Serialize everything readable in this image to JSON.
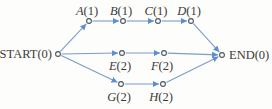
{
  "diagram": {
    "type": "activity-network",
    "background": "#fdfdfc",
    "edge_color": "#7d9cc8",
    "arrow_color": "#5c8fd2",
    "node_fill": "#fdfdfc",
    "node_stroke": "#4c5560",
    "label_color": "#3c3a38",
    "nodes": [
      {
        "id": "start",
        "name": "START",
        "value": "(0)",
        "italic": false,
        "x": 58,
        "y": 54,
        "label_pos": "left"
      },
      {
        "id": "a",
        "name": "A",
        "value": "(1)",
        "italic": true,
        "x": 89,
        "y": 21,
        "label_pos": "above"
      },
      {
        "id": "b",
        "name": "B",
        "value": "(1)",
        "italic": true,
        "x": 123,
        "y": 21,
        "label_pos": "above"
      },
      {
        "id": "c",
        "name": "C",
        "value": "(1)",
        "italic": true,
        "x": 158,
        "y": 21,
        "label_pos": "above"
      },
      {
        "id": "d",
        "name": "D",
        "value": "(1)",
        "italic": true,
        "x": 191,
        "y": 21,
        "label_pos": "above"
      },
      {
        "id": "e",
        "name": "E",
        "value": "(2)",
        "italic": true,
        "x": 122,
        "y": 53,
        "label_pos": "below"
      },
      {
        "id": "f",
        "name": "F",
        "value": "(2)",
        "italic": true,
        "x": 164,
        "y": 53,
        "label_pos": "below"
      },
      {
        "id": "g",
        "name": "G",
        "value": "(2)",
        "italic": true,
        "x": 121,
        "y": 84,
        "label_pos": "below"
      },
      {
        "id": "h",
        "name": "H",
        "value": "(2)",
        "italic": true,
        "x": 163,
        "y": 84,
        "label_pos": "below"
      },
      {
        "id": "end",
        "name": "END",
        "value": "(0)",
        "italic": false,
        "x": 222,
        "y": 55,
        "label_pos": "right"
      }
    ],
    "edges": [
      {
        "from": "start",
        "to": "a"
      },
      {
        "from": "a",
        "to": "b"
      },
      {
        "from": "b",
        "to": "c"
      },
      {
        "from": "c",
        "to": "d"
      },
      {
        "from": "d",
        "to": "end"
      },
      {
        "from": "start",
        "to": "e"
      },
      {
        "from": "e",
        "to": "f"
      },
      {
        "from": "f",
        "to": "end"
      },
      {
        "from": "start",
        "to": "g"
      },
      {
        "from": "g",
        "to": "h"
      },
      {
        "from": "h",
        "to": "end"
      }
    ]
  }
}
